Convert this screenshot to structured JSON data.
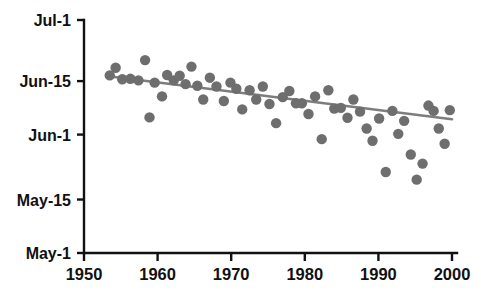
{
  "chart_data": {
    "type": "scatter",
    "title": "",
    "subtitle": "",
    "xlabel": "",
    "ylabel": "",
    "xlim": [
      1950,
      2000
    ],
    "ylim": [
      0,
      61
    ],
    "grid": false,
    "legend": null,
    "y_axis_note": "Y values are days after April 30 (May-1 = 1, May-15 = 15, Jun-1 = 32, Jun-15 = 46, Jul-1 = 62)",
    "x_ticks": [
      1950,
      1960,
      1970,
      1980,
      1990,
      2000
    ],
    "x_tick_labels": [
      "1950",
      "1960",
      "1970",
      "1980",
      "1990",
      "2000"
    ],
    "y_ticks": [
      62,
      46,
      32,
      15,
      1
    ],
    "y_tick_labels": [
      "Jul-1",
      "Jun-15",
      "Jun-1",
      "May-15",
      "May-1"
    ],
    "marker": {
      "shape": "circle",
      "color": "#6e6e6e",
      "size": 5.2
    },
    "points": [
      {
        "x": 1953.5,
        "y": 47.5
      },
      {
        "x": 1954.3,
        "y": 49.5
      },
      {
        "x": 1955.2,
        "y": 46.5
      },
      {
        "x": 1956.3,
        "y": 46.6
      },
      {
        "x": 1957.4,
        "y": 46.2
      },
      {
        "x": 1958.3,
        "y": 51.5
      },
      {
        "x": 1958.9,
        "y": 36.5
      },
      {
        "x": 1959.6,
        "y": 45.6
      },
      {
        "x": 1960.6,
        "y": 42.0
      },
      {
        "x": 1961.3,
        "y": 47.6
      },
      {
        "x": 1962.2,
        "y": 46.2
      },
      {
        "x": 1963.0,
        "y": 47.4
      },
      {
        "x": 1963.8,
        "y": 45.2
      },
      {
        "x": 1964.6,
        "y": 49.8
      },
      {
        "x": 1965.4,
        "y": 44.8
      },
      {
        "x": 1966.2,
        "y": 41.2
      },
      {
        "x": 1967.1,
        "y": 46.9
      },
      {
        "x": 1968.0,
        "y": 44.6
      },
      {
        "x": 1969.0,
        "y": 40.8
      },
      {
        "x": 1969.9,
        "y": 45.6
      },
      {
        "x": 1970.7,
        "y": 44.0
      },
      {
        "x": 1971.5,
        "y": 38.6
      },
      {
        "x": 1972.5,
        "y": 43.6
      },
      {
        "x": 1973.4,
        "y": 41.2
      },
      {
        "x": 1974.3,
        "y": 44.6
      },
      {
        "x": 1975.2,
        "y": 40.0
      },
      {
        "x": 1976.1,
        "y": 35.0
      },
      {
        "x": 1977.0,
        "y": 41.8
      },
      {
        "x": 1977.9,
        "y": 43.4
      },
      {
        "x": 1978.8,
        "y": 40.2
      },
      {
        "x": 1979.6,
        "y": 40.2
      },
      {
        "x": 1980.5,
        "y": 37.4
      },
      {
        "x": 1981.4,
        "y": 42.0
      },
      {
        "x": 1982.3,
        "y": 30.8
      },
      {
        "x": 1983.2,
        "y": 43.6
      },
      {
        "x": 1984.0,
        "y": 38.8
      },
      {
        "x": 1984.9,
        "y": 39.0
      },
      {
        "x": 1985.8,
        "y": 36.4
      },
      {
        "x": 1986.6,
        "y": 41.2
      },
      {
        "x": 1987.5,
        "y": 38.0
      },
      {
        "x": 1988.4,
        "y": 33.6
      },
      {
        "x": 1989.2,
        "y": 30.4
      },
      {
        "x": 1990.1,
        "y": 36.2
      },
      {
        "x": 1991.0,
        "y": 22.2
      },
      {
        "x": 1991.9,
        "y": 38.2
      },
      {
        "x": 1992.7,
        "y": 32.2
      },
      {
        "x": 1993.5,
        "y": 35.6
      },
      {
        "x": 1994.4,
        "y": 26.8
      },
      {
        "x": 1995.2,
        "y": 20.2
      },
      {
        "x": 1996.0,
        "y": 24.4
      },
      {
        "x": 1996.8,
        "y": 39.6
      },
      {
        "x": 1997.5,
        "y": 38.2
      },
      {
        "x": 1998.2,
        "y": 33.6
      },
      {
        "x": 1999.0,
        "y": 29.6
      },
      {
        "x": 1999.7,
        "y": 38.4
      }
    ],
    "trend_line": {
      "type": "linear-fit",
      "color": "#7d7d7d",
      "x_start": 1953.6,
      "y_start": 47.2,
      "x_end": 2000.0,
      "y_end": 36.0
    }
  }
}
